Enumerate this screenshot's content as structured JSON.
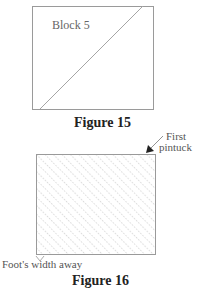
{
  "figures": [
    {
      "id": "figure-15",
      "caption": "Figure 15",
      "block_label": "Block 5",
      "box": {
        "x": 32,
        "y": 6,
        "w": 121,
        "h": 103
      },
      "diagonal": {
        "x1": 40,
        "y1": 109,
        "x2": 143,
        "y2": 6
      }
    },
    {
      "id": "figure-16",
      "caption": "Figure 16",
      "box": {
        "x": 36,
        "y": 154,
        "w": 119,
        "h": 100
      },
      "annotations": {
        "top_right": "First\npintuck",
        "top_right_line1": "First",
        "top_right_line2": "pintuck",
        "bottom_left": "Foot's width away"
      }
    }
  ],
  "colors": {
    "line": "#9a9a9a",
    "hatch": "#b0b0b0",
    "text": "#333333"
  }
}
